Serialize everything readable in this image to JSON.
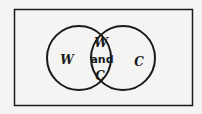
{
  "diagram": {
    "type": "venn",
    "sets": [
      {
        "id": "left",
        "label": "W"
      },
      {
        "id": "right",
        "label": "C"
      }
    ],
    "intersection": {
      "line1": "W",
      "line2": "and",
      "line3": "C"
    },
    "colors": {
      "stroke": "#1a1a1a",
      "background": "#f4f4f2"
    }
  }
}
